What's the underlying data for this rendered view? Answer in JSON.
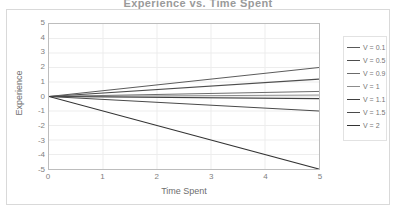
{
  "chart_data": {
    "type": "line",
    "title": "Experience vs. Time Spent",
    "xlabel": "Time Spent",
    "ylabel": "Experience",
    "xlim": [
      0,
      5
    ],
    "ylim": [
      -5,
      5
    ],
    "x": [
      0,
      5
    ],
    "xticks": [
      "0",
      "1",
      "2",
      "3",
      "4",
      "5"
    ],
    "yticks": [
      "5",
      "4",
      "3",
      "2",
      "1",
      "0",
      "-1",
      "-2",
      "-3",
      "-4",
      "-5"
    ],
    "grid": true,
    "legend_position": "right",
    "series": [
      {
        "name": "V = 0.1",
        "values": [
          0,
          2.0
        ],
        "color": "#595959",
        "width": 1.0
      },
      {
        "name": "V = 0.5",
        "values": [
          0,
          1.2
        ],
        "color": "#4d4d4d",
        "width": 1.1
      },
      {
        "name": "V = 0.9",
        "values": [
          0,
          0.35
        ],
        "color": "#6b6b6b",
        "width": 1.0
      },
      {
        "name": "V = 1",
        "values": [
          0,
          0.1
        ],
        "color": "#8c8c8c",
        "width": 1.0
      },
      {
        "name": "V = 1.1",
        "values": [
          0,
          -0.15
        ],
        "color": "#404040",
        "width": 1.2
      },
      {
        "name": "V = 1.5",
        "values": [
          0,
          -1.0
        ],
        "color": "#4a4a4a",
        "width": 1.1
      },
      {
        "name": "V = 2",
        "values": [
          0,
          -5.0
        ],
        "color": "#333333",
        "width": 1.2
      }
    ]
  },
  "style": {
    "plot_border_color": "#bdbdbd",
    "frame_border_color": "#d9d9d9",
    "gridline_color": "#ededed",
    "tick_text_color": "#808080",
    "axis_title_color": "#6e6e6e",
    "legend_text_color": "#767676",
    "background": "#ffffff"
  }
}
